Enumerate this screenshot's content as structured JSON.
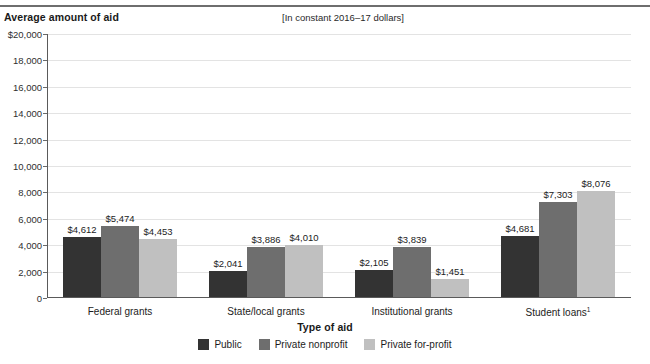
{
  "header": {
    "y_axis_title": "Average amount of aid",
    "units_note": "[In constant 2016–17 dollars]"
  },
  "axes": {
    "x_title": "Type of aid",
    "y_ticks": [
      "$20,000",
      "18,000",
      "16,000",
      "14,000",
      "12,000",
      "10,000",
      "8,000",
      "6,000",
      "4,000",
      "2,000",
      "0"
    ],
    "y_tick_values": [
      20000,
      18000,
      16000,
      14000,
      12000,
      10000,
      8000,
      6000,
      4000,
      2000,
      0
    ]
  },
  "legend": {
    "items": [
      {
        "label": "Public",
        "color": "#333333"
      },
      {
        "label": "Private nonprofit",
        "color": "#6e6e6e"
      },
      {
        "label": "Private for-profit",
        "color": "#c0c0c0"
      }
    ]
  },
  "footnote_marker": "1",
  "chart_data": {
    "type": "bar",
    "title": "Average amount of aid",
    "subtitle": "[In constant 2016–17 dollars]",
    "xlabel": "Type of aid",
    "ylabel": "Average amount of aid",
    "ylim": [
      0,
      20000
    ],
    "ytick_step": 2000,
    "grid": true,
    "legend_position": "bottom",
    "categories": [
      "Federal grants",
      "State/local grants",
      "Institutional grants",
      "Student loans¹"
    ],
    "series": [
      {
        "name": "Public",
        "color": "#333333",
        "values": [
          4612,
          2041,
          2105,
          4681
        ],
        "labels": [
          "$4,612",
          "$2,041",
          "$2,105",
          "$4,681"
        ]
      },
      {
        "name": "Private nonprofit",
        "color": "#6e6e6e",
        "values": [
          5474,
          3886,
          3839,
          7303
        ],
        "labels": [
          "$5,474",
          "$3,886",
          "$3,839",
          "$7,303"
        ]
      },
      {
        "name": "Private for-profit",
        "color": "#c0c0c0",
        "values": [
          4453,
          4010,
          1451,
          8076
        ],
        "labels": [
          "$4,453",
          "$4,010",
          "$1,451",
          "$8,076"
        ]
      }
    ]
  }
}
